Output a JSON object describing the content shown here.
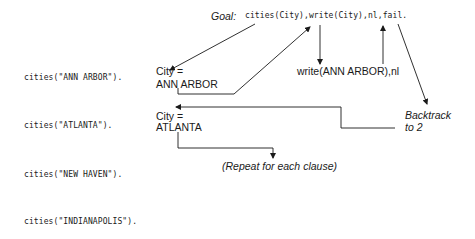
{
  "goal": {
    "label": "Goal:",
    "query": "cities(City),write(City),nl,fail."
  },
  "clauses": [
    "cities(\"ANN ARBOR\").",
    "cities(\"ATLANTA\").",
    "cities(\"NEW HAVEN\").",
    "cities(\"INDIANAPOLIS\")."
  ],
  "bindings": [
    {
      "lhs": "City =",
      "value": "ANN ARBOR"
    },
    {
      "lhs": "City =",
      "value": "ATLANTA"
    }
  ],
  "write_step": "write(ANN ARBOR),nl",
  "backtrack": {
    "line1": "Backtrack",
    "line2": "to 2"
  },
  "repeat_note": "(Repeat for each clause)"
}
